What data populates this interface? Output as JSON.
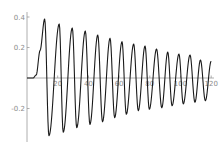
{
  "chart_data": {
    "type": "line",
    "title": "",
    "xlabel": "",
    "ylabel": "",
    "xlim": [
      0,
      120
    ],
    "ylim": [
      -0.42,
      0.43
    ],
    "grid": false,
    "legend": null,
    "x_ticks": [
      {
        "value": 20,
        "label": "20"
      },
      {
        "value": 40,
        "label": "40"
      },
      {
        "value": 60,
        "label": "60"
      },
      {
        "value": 80,
        "label": "80"
      },
      {
        "value": 100,
        "label": "100"
      },
      {
        "value": 120,
        "label": "120"
      }
    ],
    "y_ticks": [
      {
        "value": 0.4,
        "label": "0.4"
      },
      {
        "value": 0.2,
        "label": "0.2"
      },
      {
        "value": -0.2,
        "label": "-0.2"
      }
    ],
    "series": [
      {
        "name": "damped oscillation",
        "color": "#1a1a1a",
        "description": "Damped oscillation with onset near x=4, extrema read from figure",
        "x": [
          0,
          4,
          6,
          8.5,
          11.5,
          14.3,
          21.0,
          23.6,
          29.5,
          32.4,
          38.0,
          41.0,
          46.1,
          49.2,
          54.1,
          57.1,
          61.9,
          64.7,
          69.5,
          72.5,
          76.9,
          79.7,
          84.4,
          87.8,
          91.7,
          94.5,
          99.0,
          101.8,
          106.2,
          109.4,
          113.0,
          116.2,
          120
        ],
        "y": [
          0,
          0.0,
          0.02,
          0.18,
          0.387,
          -0.378,
          0.354,
          -0.356,
          0.328,
          -0.326,
          0.308,
          -0.304,
          0.282,
          -0.287,
          0.26,
          -0.26,
          0.238,
          -0.238,
          0.223,
          -0.214,
          0.21,
          -0.205,
          0.19,
          -0.195,
          0.17,
          -0.182,
          0.157,
          -0.17,
          0.151,
          -0.159,
          0.118,
          -0.149,
          0.11
        ],
        "kind": [
          "flat",
          "flat",
          "onset",
          "onset",
          "peak",
          "trough",
          "peak",
          "trough",
          "peak",
          "trough",
          "peak",
          "trough",
          "peak",
          "trough",
          "peak",
          "trough",
          "peak",
          "trough",
          "peak",
          "trough",
          "peak",
          "trough",
          "peak",
          "trough",
          "peak",
          "trough",
          "peak",
          "trough",
          "peak",
          "trough",
          "peak",
          "trough",
          "end"
        ]
      }
    ]
  },
  "layout": {
    "origin_px": [
      27,
      78
    ],
    "x_px_per_unit": 1.535,
    "y_px_per_unit": 152.5,
    "y_axis_px_range": [
      12,
      142
    ],
    "x_axis_px_range": [
      27,
      214
    ]
  }
}
